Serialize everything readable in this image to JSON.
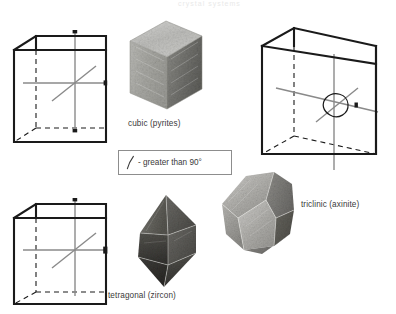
{
  "figure": {
    "title_remnant": "crystal systems",
    "background_color": "#ffffff",
    "line_color": "#1a1a1a",
    "axis_color": "#8a8a8a",
    "caption_color": "#3a3a3a"
  },
  "legend": {
    "symbol_name": "oblique-angle-mark",
    "text": "- greater than 90°",
    "border_color": "#8d8d8d"
  },
  "captions": {
    "cubic": "cubic (pyrites)",
    "tetragonal": "tetragonal (zircon)",
    "triclinic": "triclinic (axinite)"
  },
  "crystal_systems": [
    {
      "id": "cubic",
      "name": "cubic",
      "mineral": "pyrites",
      "caption": "cubic (pyrites)",
      "cell_shape": "cube",
      "axes_count": 3,
      "angles": "all 90°",
      "specimen_form": "cube",
      "specimen_tone": "light-gray"
    },
    {
      "id": "tetragonal",
      "name": "tetragonal",
      "mineral": "zircon",
      "caption": "tetragonal (zircon)",
      "cell_shape": "square prism",
      "axes_count": 3,
      "angles": "all 90°",
      "specimen_form": "bipyramid",
      "specimen_tone": "dark-gray"
    },
    {
      "id": "triclinic",
      "name": "triclinic",
      "mineral": "axinite",
      "caption": "triclinic (axinite)",
      "cell_shape": "oblique parallelepiped",
      "axes_count": 3,
      "angles": "none 90°",
      "angle_marker": "greater than 90°",
      "specimen_form": "wedge",
      "specimen_tone": "mid-gray"
    }
  ]
}
